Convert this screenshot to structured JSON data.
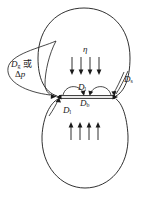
{
  "figure": {
    "background_color": "#ffffff",
    "stroke_color": "#1a1a1a",
    "labels": {
      "driving_force_main": "D",
      "driving_force_sub": "g",
      "driving_force_or": " 或",
      "delta_p_symbol": "Δ",
      "delta_p_var": "p",
      "viscosity": "η",
      "surface_diffusion_main": "D",
      "surface_diffusion_sub": "s",
      "lattice_diffusion_top_main": "D",
      "lattice_diffusion_top_sub": "l",
      "boundary_diffusion_main": "D",
      "boundary_diffusion_sub": "b",
      "lattice_diffusion_bottom_main": "D",
      "lattice_diffusion_bottom_sub": "l"
    },
    "arrows": {
      "top_count": 4,
      "top_direction": "down",
      "bottom_count": 4,
      "bottom_direction": "up"
    },
    "spheres": [
      {
        "name": "upper-sphere",
        "cx": 84,
        "cy": 52,
        "r": 46
      },
      {
        "name": "lower-sphere",
        "cx": 85,
        "cy": 144,
        "r": 44
      }
    ],
    "neck": {
      "left_x": 57,
      "right_x": 116,
      "y": 97
    }
  }
}
